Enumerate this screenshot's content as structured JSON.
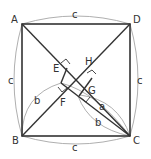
{
  "diagram": {
    "type": "geometry",
    "colors": {
      "main_line": "#333333",
      "arc_line": "#999999",
      "text": "#333333",
      "background": "#ffffff"
    },
    "points": {
      "A": "A",
      "B": "B",
      "C": "C",
      "D": "D",
      "E": "E",
      "F": "F",
      "G": "G",
      "H": "H"
    },
    "lengths": {
      "top": "c",
      "bottom": "c",
      "left": "c",
      "right": "c",
      "b_left": "b",
      "a_right": "a",
      "b_right": "b"
    }
  }
}
